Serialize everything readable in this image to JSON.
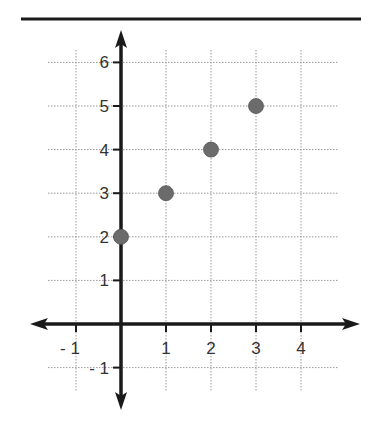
{
  "chart_data": {
    "type": "scatter",
    "title": "",
    "xlabel": "",
    "ylabel": "",
    "x_ticks": [
      "- 1",
      "1",
      "2",
      "3",
      "4"
    ],
    "y_ticks": [
      "6",
      "5",
      "4",
      "3",
      "2",
      "1",
      "- 1"
    ],
    "xlim": [
      -1,
      4.5
    ],
    "ylim": [
      -1,
      6.5
    ],
    "grid": true,
    "legend": null,
    "points": [
      {
        "x": 0,
        "y": 2
      },
      {
        "x": 1,
        "y": 3
      },
      {
        "x": 2,
        "y": 4
      },
      {
        "x": 3,
        "y": 5
      }
    ],
    "colors": {
      "point": "#6b6b6b",
      "axis": "#1a1a1a",
      "grid": "#999999",
      "top_rule": "#1a1a1a"
    }
  }
}
